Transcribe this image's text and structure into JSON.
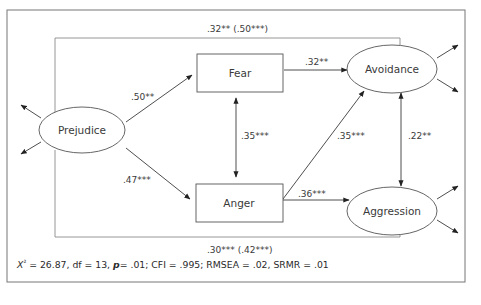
{
  "diagram": {
    "type": "path-model",
    "colors": {
      "line": "#3a3a3a",
      "frame": "#777777",
      "background": "#ffffff"
    },
    "nodes": {
      "prejudice": {
        "label": "Prejudice",
        "shape": "ellipse"
      },
      "fear": {
        "label": "Fear",
        "shape": "rectangle"
      },
      "anger": {
        "label": "Anger",
        "shape": "rectangle"
      },
      "avoidance": {
        "label": "Avoidance",
        "shape": "ellipse"
      },
      "aggression": {
        "label": "Aggression",
        "shape": "ellipse"
      }
    },
    "edges": {
      "prejudice_fear": {
        "from": "Prejudice",
        "to": "Fear",
        "label": ".50**"
      },
      "prejudice_anger": {
        "from": "Prejudice",
        "to": "Anger",
        "label": ".47***"
      },
      "fear_avoidance": {
        "from": "Fear",
        "to": "Avoidance",
        "label": ".32**"
      },
      "fear_anger": {
        "from": "Fear",
        "to": "Anger",
        "label": ".35***",
        "bidirectional": true
      },
      "anger_avoidance": {
        "from": "Anger",
        "to": "Avoidance",
        "label": ".35***"
      },
      "anger_aggression": {
        "from": "Anger",
        "to": "Aggression",
        "label": ".36***"
      },
      "avoidance_aggression": {
        "from": "Avoidance",
        "to": "Aggression",
        "label": ".22**",
        "bidirectional": true
      },
      "prejudice_avoidance_direct": {
        "from": "Prejudice",
        "to": "Avoidance",
        "label": ".32** (.50***)"
      },
      "prejudice_aggression_direct": {
        "from": "Prejudice",
        "to": "Aggression",
        "label": ".30*** (.42***)"
      }
    },
    "fit_statistics": {
      "chi_symbol": "X",
      "chi_sup": "²",
      "chi_value": " = 26.87, df = 13, ",
      "p_symbol": "p",
      "rest": "= .01; CFI = .995; RMSEA = .02, SRMR = .01"
    }
  }
}
